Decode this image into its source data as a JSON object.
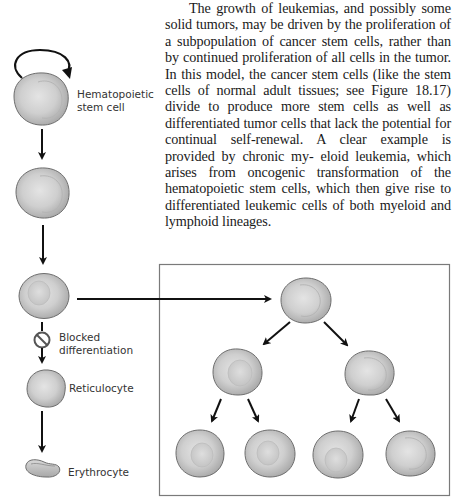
{
  "paragraph": {
    "lines": [
      "The growth of leukemias, and possibly some",
      "solid tumors, may be driven by the proliferation",
      "of a subpopulation of cancer stem cells, rather",
      "than by continued proliferation of all cells in",
      "the tumor. In this model, the cancer stem cells",
      "(like the stem cells of normal adult tissues;",
      "see Figure 18.17) divide to produce more stem",
      "cells as well as differentiated tumor cells that",
      "lack the potential for continual self-renewal.",
      "A clear example is provided by chronic my-",
      "eloid leukemia, which arises from oncogenic",
      "transformation of the hematopoietic stem cells,",
      "which then give rise to differentiated leukemic",
      "cells of both myeloid and lymphoid lineages."
    ]
  },
  "figure": {
    "labels": {
      "stem_cell_line1": "Hematopoietic",
      "stem_cell_line2": "stem cell",
      "blocked_line1": "Blocked",
      "blocked_line2": "differentiation",
      "reticulocyte": "Reticulocyte",
      "erythrocyte": "Erythrocyte"
    },
    "icons": {
      "self_renewal": "circular-arrow-icon",
      "blocked": "prohibition-icon"
    },
    "colors": {
      "cell_fill": "#c4c4c4",
      "cell_highlight": "#e6e6e6",
      "cell_outline": "#6e6e6e",
      "arrow": "#111111",
      "box_border": "#7a7a7a"
    },
    "lineage": [
      "Hematopoietic stem cell",
      "Progenitor cell",
      "Progenitor cell",
      "Blocked differentiation",
      "Reticulocyte",
      "Erythrocyte"
    ],
    "tree": {
      "levels": [
        1,
        2,
        4
      ]
    }
  }
}
